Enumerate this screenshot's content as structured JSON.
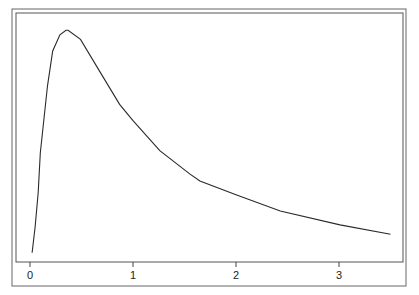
{
  "chart_data": {
    "type": "line",
    "title": "",
    "xlabel": "",
    "ylabel": "",
    "xlim": [
      -0.13,
      3.62
    ],
    "ylim": [
      0,
      1.0
    ],
    "grid": false,
    "legend": null,
    "x_ticks": [
      0,
      1,
      2,
      3
    ],
    "x_tick_labels": [
      "0",
      "1",
      "2",
      "3"
    ],
    "y_ticks": [],
    "series": [
      {
        "name": "density",
        "x": [
          0.02,
          0.05,
          0.08,
          0.1,
          0.17,
          0.22,
          0.29,
          0.35,
          0.37,
          0.49,
          0.68,
          0.87,
          1.0,
          1.26,
          1.55,
          1.65,
          2.0,
          2.43,
          3.01,
          3.5
        ],
        "values": [
          0.04,
          0.15,
          0.3,
          0.47,
          0.76,
          0.91,
          0.98,
          1.0,
          1.0,
          0.96,
          0.82,
          0.68,
          0.61,
          0.48,
          0.38,
          0.35,
          0.29,
          0.22,
          0.16,
          0.12
        ]
      }
    ]
  },
  "colors": {
    "line": "#2a2a2a",
    "frame": "#555555",
    "background": "#ffffff"
  }
}
